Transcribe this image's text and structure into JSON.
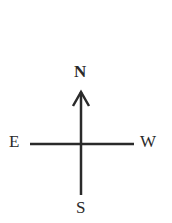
{
  "compass": {
    "north": "N",
    "south": "S",
    "east": "E",
    "west": "W"
  },
  "colors": {
    "stroke": "#2a2a2a",
    "background": "#ffffff"
  }
}
